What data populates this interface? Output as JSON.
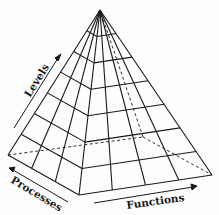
{
  "diagram": {
    "type": "pyramid",
    "grid": {
      "rows": 7,
      "front_columns": 4,
      "side_columns": 3
    },
    "labels": {
      "levels": "Levels",
      "processes": "Processes",
      "functions": "Functions"
    },
    "colors": {
      "line": "#1a1a1a",
      "background": "#fdfdfd"
    }
  }
}
